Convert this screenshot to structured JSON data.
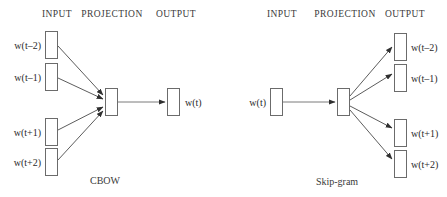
{
  "figure": {
    "background_color": "#ffffff",
    "stroke_color": "#6b6b6b",
    "arrow_color": "#4a4a4a",
    "text_color": "#2a2a2a"
  },
  "cbow": {
    "caption": "CBOW",
    "headers": {
      "input": "INPUT",
      "projection": "PROJECTION",
      "output": "OUTPUT"
    },
    "input_nodes": [
      {
        "label": "w(t–2)"
      },
      {
        "label": "w(t–1)"
      },
      {
        "label": "w(t+1)"
      },
      {
        "label": "w(t+2)"
      }
    ],
    "projection_node": {
      "label": ""
    },
    "output_nodes": [
      {
        "label": "w(t)"
      }
    ]
  },
  "skipgram": {
    "caption": "Skip-gram",
    "headers": {
      "input": "INPUT",
      "projection": "PROJECTION",
      "output": "OUTPUT"
    },
    "input_nodes": [
      {
        "label": "w(t)"
      }
    ],
    "projection_node": {
      "label": ""
    },
    "output_nodes": [
      {
        "label": "w(t–2)"
      },
      {
        "label": "w(t–1)"
      },
      {
        "label": "w(t+1)"
      },
      {
        "label": "w(t+2)"
      }
    ]
  }
}
